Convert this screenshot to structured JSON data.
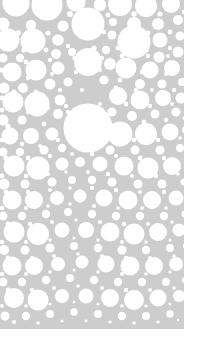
{
  "artwork": {
    "title": "Circle Packing Pattern",
    "description": "Abstract decorative circle-packing texture of white discs of varying radii on a light gray field",
    "style": "apollonian-circle-packing",
    "canvas": {
      "width": 199,
      "height": 345
    },
    "colors": {
      "page_background": "#ffffff",
      "field_background": "#cdcdcd",
      "circle_fill": "#ffffff",
      "circle_edge_soft": "#dedede"
    },
    "field": {
      "x": 0,
      "y": 0,
      "width": 184,
      "height": 329
    },
    "margins": {
      "right": 15,
      "bottom": 16,
      "left": 0,
      "top": 0
    },
    "bleed_edges": [
      "left",
      "top"
    ],
    "circle_count": 286,
    "radius_range": [
      1.1,
      24.5
    ],
    "circles": [
      [
        16,
        3,
        13.5
      ],
      [
        47,
        5,
        15.5
      ],
      [
        76,
        2,
        9.5
      ],
      [
        100,
        5,
        6.2
      ],
      [
        120,
        4,
        12.0
      ],
      [
        146,
        6,
        11.0
      ],
      [
        171,
        4,
        9.0
      ],
      [
        3,
        24,
        6.5
      ],
      [
        31,
        25,
        5.2
      ],
      [
        63,
        26,
        5.5
      ],
      [
        88,
        24,
        16.5
      ],
      [
        113,
        22,
        4.0
      ],
      [
        134,
        24,
        7.0
      ],
      [
        158,
        24,
        6.0
      ],
      [
        178,
        20,
        5.0
      ],
      [
        8,
        40,
        11.5
      ],
      [
        33,
        41,
        12.5
      ],
      [
        58,
        40,
        5.8
      ],
      [
        112,
        35,
        4.5
      ],
      [
        134,
        42,
        16.5
      ],
      [
        160,
        40,
        7.5
      ],
      [
        180,
        36,
        4.5
      ],
      [
        3,
        58,
        4.5
      ],
      [
        20,
        58,
        4.2
      ],
      [
        56,
        54,
        5.0
      ],
      [
        72,
        52,
        4.0
      ],
      [
        106,
        50,
        4.2
      ],
      [
        159,
        57,
        5.5
      ],
      [
        178,
        52,
        5.5
      ],
      [
        12,
        72,
        9.5
      ],
      [
        36,
        70,
        10.5
      ],
      [
        58,
        68,
        6.5
      ],
      [
        88,
        62,
        14.0
      ],
      [
        110,
        64,
        6.0
      ],
      [
        126,
        68,
        10.5
      ],
      [
        150,
        70,
        8.5
      ],
      [
        172,
        68,
        8.0
      ],
      [
        4,
        88,
        5.5
      ],
      [
        23,
        88,
        5.0
      ],
      [
        50,
        84,
        5.5
      ],
      [
        68,
        82,
        4.5
      ],
      [
        104,
        80,
        4.5
      ],
      [
        140,
        84,
        5.0
      ],
      [
        162,
        84,
        4.5
      ],
      [
        182,
        82,
        4.0
      ],
      [
        13,
        102,
        10.5
      ],
      [
        37,
        104,
        12.5
      ],
      [
        60,
        100,
        5.5
      ],
      [
        88,
        128,
        24.5
      ],
      [
        118,
        96,
        9.0
      ],
      [
        140,
        100,
        9.5
      ],
      [
        163,
        98,
        8.0
      ],
      [
        181,
        98,
        5.5
      ],
      [
        3,
        120,
        5.5
      ],
      [
        22,
        120,
        4.5
      ],
      [
        58,
        114,
        5.0
      ],
      [
        112,
        112,
        4.5
      ],
      [
        132,
        116,
        5.0
      ],
      [
        155,
        114,
        4.5
      ],
      [
        176,
        112,
        4.5
      ],
      [
        10,
        136,
        8.5
      ],
      [
        31,
        136,
        8.0
      ],
      [
        52,
        134,
        6.5
      ],
      [
        120,
        134,
        12.5
      ],
      [
        146,
        134,
        11.0
      ],
      [
        170,
        132,
        8.5
      ],
      [
        186,
        130,
        4.0
      ],
      [
        3,
        152,
        4.5
      ],
      [
        20,
        152,
        4.2
      ],
      [
        44,
        150,
        4.5
      ],
      [
        62,
        148,
        4.2
      ],
      [
        110,
        150,
        4.5
      ],
      [
        135,
        150,
        4.5
      ],
      [
        160,
        150,
        4.5
      ],
      [
        180,
        148,
        4.0
      ],
      [
        14,
        166,
        10.5
      ],
      [
        38,
        168,
        11.5
      ],
      [
        62,
        164,
        6.5
      ],
      [
        80,
        162,
        5.0
      ],
      [
        100,
        164,
        7.5
      ],
      [
        124,
        166,
        9.5
      ],
      [
        148,
        168,
        10.5
      ],
      [
        172,
        166,
        9.0
      ],
      [
        4,
        184,
        5.5
      ],
      [
        25,
        184,
        4.5
      ],
      [
        52,
        182,
        4.5
      ],
      [
        72,
        180,
        4.0
      ],
      [
        92,
        180,
        4.2
      ],
      [
        112,
        182,
        4.5
      ],
      [
        138,
        184,
        4.5
      ],
      [
        162,
        184,
        4.5
      ],
      [
        184,
        182,
        3.5
      ],
      [
        12,
        200,
        9.5
      ],
      [
        34,
        200,
        9.0
      ],
      [
        57,
        198,
        7.0
      ],
      [
        80,
        196,
        6.5
      ],
      [
        104,
        198,
        8.5
      ],
      [
        128,
        200,
        9.5
      ],
      [
        152,
        200,
        9.0
      ],
      [
        176,
        198,
        7.5
      ],
      [
        3,
        216,
        4.5
      ],
      [
        22,
        216,
        4.2
      ],
      [
        46,
        214,
        4.2
      ],
      [
        68,
        212,
        4.0
      ],
      [
        92,
        214,
        4.2
      ],
      [
        116,
        216,
        4.2
      ],
      [
        140,
        216,
        4.2
      ],
      [
        164,
        216,
        4.2
      ],
      [
        185,
        214,
        3.5
      ],
      [
        14,
        232,
        10.5
      ],
      [
        38,
        234,
        11.0
      ],
      [
        62,
        230,
        7.5
      ],
      [
        86,
        230,
        8.0
      ],
      [
        110,
        232,
        9.5
      ],
      [
        134,
        234,
        10.5
      ],
      [
        158,
        232,
        9.0
      ],
      [
        179,
        230,
        6.5
      ],
      [
        4,
        250,
        5.0
      ],
      [
        25,
        250,
        4.5
      ],
      [
        50,
        248,
        4.5
      ],
      [
        74,
        246,
        4.0
      ],
      [
        98,
        248,
        4.2
      ],
      [
        122,
        250,
        4.5
      ],
      [
        146,
        250,
        4.2
      ],
      [
        170,
        248,
        4.0
      ],
      [
        186,
        246,
        3.2
      ],
      [
        12,
        266,
        9.5
      ],
      [
        34,
        266,
        9.0
      ],
      [
        58,
        264,
        7.0
      ],
      [
        82,
        262,
        6.5
      ],
      [
        106,
        264,
        8.5
      ],
      [
        130,
        266,
        9.5
      ],
      [
        154,
        266,
        9.0
      ],
      [
        176,
        264,
        7.0
      ],
      [
        3,
        282,
        4.5
      ],
      [
        22,
        282,
        4.2
      ],
      [
        46,
        280,
        4.2
      ],
      [
        70,
        278,
        4.0
      ],
      [
        94,
        280,
        4.2
      ],
      [
        118,
        282,
        4.2
      ],
      [
        142,
        282,
        4.2
      ],
      [
        166,
        282,
        4.0
      ],
      [
        185,
        280,
        3.2
      ],
      [
        14,
        298,
        10.0
      ],
      [
        38,
        300,
        10.5
      ],
      [
        62,
        296,
        7.0
      ],
      [
        86,
        296,
        7.5
      ],
      [
        110,
        298,
        9.0
      ],
      [
        134,
        300,
        10.0
      ],
      [
        158,
        298,
        8.5
      ],
      [
        179,
        296,
        6.0
      ],
      [
        5,
        316,
        4.5
      ],
      [
        26,
        316,
        4.2
      ],
      [
        50,
        314,
        4.0
      ],
      [
        74,
        312,
        3.8
      ],
      [
        98,
        314,
        4.0
      ],
      [
        122,
        316,
        4.2
      ],
      [
        146,
        316,
        4.0
      ],
      [
        170,
        314,
        3.8
      ],
      [
        70,
        14,
        3.0
      ],
      [
        92,
        13,
        2.6
      ],
      [
        108,
        15,
        2.4
      ],
      [
        134,
        14,
        2.8
      ],
      [
        160,
        14,
        2.6
      ],
      [
        184,
        12,
        2.2
      ],
      [
        18,
        33,
        2.8
      ],
      [
        48,
        33,
        2.6
      ],
      [
        76,
        32,
        2.4
      ],
      [
        104,
        32,
        2.2
      ],
      [
        124,
        33,
        2.6
      ],
      [
        148,
        33,
        2.4
      ],
      [
        170,
        32,
        2.4
      ],
      [
        24,
        50,
        2.6
      ],
      [
        46,
        50,
        2.4
      ],
      [
        68,
        46,
        2.2
      ],
      [
        94,
        48,
        2.6
      ],
      [
        118,
        48,
        2.4
      ],
      [
        146,
        50,
        2.6
      ],
      [
        170,
        48,
        2.2
      ],
      [
        2,
        70,
        2.6
      ],
      [
        26,
        62,
        2.4
      ],
      [
        50,
        60,
        2.2
      ],
      [
        74,
        58,
        2.0
      ],
      [
        102,
        58,
        2.2
      ],
      [
        122,
        56,
        2.4
      ],
      [
        148,
        56,
        2.2
      ],
      [
        168,
        56,
        2.0
      ],
      [
        2,
        98,
        2.4
      ],
      [
        28,
        78,
        2.2
      ],
      [
        52,
        74,
        2.0
      ],
      [
        76,
        72,
        2.2
      ],
      [
        100,
        70,
        2.0
      ],
      [
        120,
        80,
        2.4
      ],
      [
        142,
        72,
        2.2
      ],
      [
        166,
        74,
        2.0
      ],
      [
        14,
        92,
        2.6
      ],
      [
        36,
        92,
        2.4
      ],
      [
        60,
        90,
        2.2
      ],
      [
        82,
        90,
        2.0
      ],
      [
        116,
        88,
        2.4
      ],
      [
        136,
        90,
        2.2
      ],
      [
        152,
        90,
        2.0
      ],
      [
        174,
        90,
        2.2
      ],
      [
        2,
        110,
        2.4
      ],
      [
        28,
        112,
        2.2
      ],
      [
        48,
        108,
        2.0
      ],
      [
        66,
        106,
        2.2
      ],
      [
        100,
        104,
        2.0
      ],
      [
        126,
        104,
        2.4
      ],
      [
        150,
        106,
        2.2
      ],
      [
        172,
        104,
        2.0
      ],
      [
        8,
        126,
        2.6
      ],
      [
        44,
        124,
        2.4
      ],
      [
        68,
        112,
        2.2
      ],
      [
        104,
        122,
        2.0
      ],
      [
        144,
        122,
        2.4
      ],
      [
        166,
        120,
        2.2
      ],
      [
        184,
        118,
        1.8
      ],
      [
        2,
        140,
        2.4
      ],
      [
        22,
        144,
        2.2
      ],
      [
        40,
        146,
        2.0
      ],
      [
        58,
        140,
        2.2
      ],
      [
        100,
        140,
        2.0
      ],
      [
        134,
        140,
        2.4
      ],
      [
        158,
        140,
        2.2
      ],
      [
        180,
        138,
        1.8
      ],
      [
        6,
        158,
        2.6
      ],
      [
        28,
        158,
        2.4
      ],
      [
        50,
        156,
        2.2
      ],
      [
        72,
        154,
        2.0
      ],
      [
        92,
        154,
        2.2
      ],
      [
        116,
        156,
        2.0
      ],
      [
        140,
        158,
        2.4
      ],
      [
        164,
        158,
        2.2
      ],
      [
        186,
        156,
        1.6
      ],
      [
        2,
        176,
        2.4
      ],
      [
        26,
        176,
        2.2
      ],
      [
        48,
        174,
        2.0
      ],
      [
        66,
        172,
        1.8
      ],
      [
        88,
        172,
        2.0
      ],
      [
        108,
        174,
        2.2
      ],
      [
        132,
        176,
        2.0
      ],
      [
        156,
        176,
        2.2
      ],
      [
        178,
        174,
        1.8
      ],
      [
        6,
        192,
        2.4
      ],
      [
        28,
        192,
        2.2
      ],
      [
        50,
        190,
        2.0
      ],
      [
        70,
        188,
        1.8
      ],
      [
        92,
        188,
        2.0
      ],
      [
        116,
        190,
        2.2
      ],
      [
        140,
        192,
        2.0
      ],
      [
        164,
        192,
        2.2
      ],
      [
        186,
        190,
        1.6
      ],
      [
        2,
        208,
        2.2
      ],
      [
        26,
        208,
        2.0
      ],
      [
        48,
        206,
        1.8
      ],
      [
        70,
        204,
        1.8
      ],
      [
        94,
        206,
        2.0
      ],
      [
        118,
        208,
        1.8
      ],
      [
        142,
        208,
        2.0
      ],
      [
        166,
        208,
        1.8
      ],
      [
        8,
        224,
        2.4
      ],
      [
        30,
        224,
        2.2
      ],
      [
        52,
        222,
        2.0
      ],
      [
        76,
        220,
        1.8
      ],
      [
        100,
        222,
        2.0
      ],
      [
        124,
        224,
        2.2
      ],
      [
        148,
        224,
        2.0
      ],
      [
        172,
        222,
        1.8
      ],
      [
        186,
        220,
        1.4
      ],
      [
        2,
        242,
        2.2
      ],
      [
        26,
        242,
        2.0
      ],
      [
        50,
        240,
        1.8
      ],
      [
        74,
        238,
        1.6
      ],
      [
        98,
        240,
        1.8
      ],
      [
        122,
        242,
        2.0
      ],
      [
        146,
        242,
        1.8
      ],
      [
        170,
        240,
        1.6
      ],
      [
        8,
        258,
        2.4
      ],
      [
        32,
        258,
        2.2
      ],
      [
        54,
        256,
        2.0
      ],
      [
        78,
        254,
        1.8
      ],
      [
        102,
        256,
        2.0
      ],
      [
        126,
        258,
        2.2
      ],
      [
        150,
        258,
        2.0
      ],
      [
        174,
        256,
        1.8
      ],
      [
        2,
        274,
        2.2
      ],
      [
        26,
        274,
        2.0
      ],
      [
        50,
        272,
        1.8
      ],
      [
        74,
        270,
        1.6
      ],
      [
        98,
        272,
        1.8
      ],
      [
        122,
        274,
        2.0
      ],
      [
        146,
        274,
        1.8
      ],
      [
        170,
        272,
        1.6
      ],
      [
        8,
        290,
        2.4
      ],
      [
        32,
        290,
        2.2
      ],
      [
        54,
        288,
        2.0
      ],
      [
        78,
        286,
        1.8
      ],
      [
        102,
        288,
        2.0
      ],
      [
        126,
        290,
        2.2
      ],
      [
        150,
        290,
        2.0
      ],
      [
        174,
        288,
        1.8
      ],
      [
        2,
        306,
        2.0
      ],
      [
        26,
        306,
        1.8
      ],
      [
        50,
        304,
        1.6
      ],
      [
        74,
        302,
        1.4
      ],
      [
        98,
        304,
        1.6
      ],
      [
        122,
        306,
        1.8
      ],
      [
        146,
        306,
        1.6
      ],
      [
        170,
        304,
        1.4
      ],
      [
        14,
        322,
        2.0
      ],
      [
        38,
        323,
        1.8
      ],
      [
        62,
        321,
        1.6
      ],
      [
        86,
        321,
        1.4
      ],
      [
        110,
        322,
        1.6
      ],
      [
        134,
        323,
        1.8
      ],
      [
        158,
        322,
        1.6
      ],
      [
        178,
        320,
        1.2
      ]
    ]
  }
}
